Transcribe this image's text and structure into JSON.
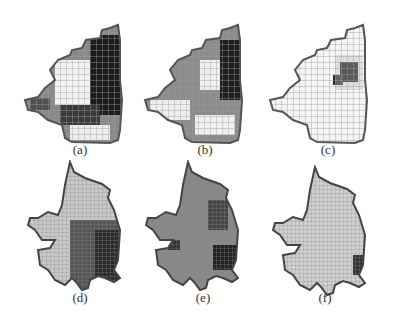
{
  "figure": {
    "panels": [
      {
        "id": "a",
        "label": "(a)",
        "shade": "mixed-dark-east",
        "row": 1
      },
      {
        "id": "b",
        "label": "(b)",
        "shade": "gray-dark-northeast",
        "row": 1
      },
      {
        "id": "c",
        "label": "(c)",
        "shade": "light-small-dark-spot",
        "row": 1
      },
      {
        "id": "d",
        "label": "(d)",
        "shade": "light-west-dark-east",
        "row": 2
      },
      {
        "id": "e",
        "label": "(e)",
        "shade": "gray-scattered-dark",
        "row": 2
      },
      {
        "id": "f",
        "label": "(f)",
        "shade": "light-dark-east-edge",
        "row": 2
      }
    ],
    "colors": {
      "outline": "#555555",
      "grid": "#9a9a9a",
      "dark": "#1a1a1a",
      "mid": "#7a7a7a",
      "light": "#f4f4f4"
    }
  }
}
